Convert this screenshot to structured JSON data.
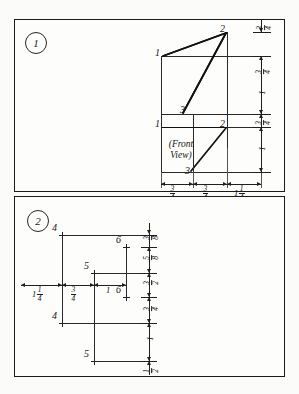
{
  "sheet": {
    "background_color": "#fbfbf9",
    "ink_color": "#111111"
  },
  "panels": [
    {
      "badge": "1",
      "view_label": "(Front\nView)",
      "view_label_line1": "(Front",
      "view_label_line2": "View)",
      "point_labels": [
        "1",
        "2",
        "1",
        "3",
        "2",
        "3"
      ],
      "points": {
        "top_left": "1",
        "apex": "2",
        "mid_left": "1",
        "mid": "3",
        "lower_right": "2",
        "lower": "3"
      },
      "horizontal_dimensions": [
        {
          "whole": "",
          "num": "3",
          "den": "4"
        },
        {
          "whole": "",
          "num": "3",
          "den": "4"
        },
        {
          "whole": "1",
          "num": "1",
          "den": "4"
        }
      ],
      "vertical_dimensions": [
        {
          "whole": "",
          "num": "3",
          "den": "4"
        },
        {
          "whole": "",
          "num": "3",
          "den": "4"
        },
        {
          "whole": "1",
          "num": "",
          "den": ""
        },
        {
          "whole": "",
          "num": "3",
          "den": "4"
        },
        {
          "whole": "1",
          "num": "",
          "den": ""
        }
      ]
    },
    {
      "badge": "2",
      "point_labels": [
        "4",
        "6",
        "5",
        "6",
        "4",
        "5"
      ],
      "points": {
        "top_left": "4",
        "upper_right": "6",
        "mid_left": "5",
        "mid_right": "6",
        "lower_left": "4",
        "bottom_left": "5"
      },
      "horizontal_dimensions": [
        {
          "whole": "1",
          "num": "1",
          "den": "4"
        },
        {
          "whole": "",
          "num": "3",
          "den": "4"
        },
        {
          "whole": "1",
          "num": "",
          "den": ""
        }
      ],
      "vertical_dimensions": [
        {
          "whole": "",
          "num": "3",
          "den": "8"
        },
        {
          "whole": "",
          "num": "5",
          "den": "8"
        },
        {
          "whole": "",
          "num": "3",
          "den": "2"
        },
        {
          "whole": "",
          "num": "3",
          "den": "4"
        },
        {
          "whole": "1",
          "num": "",
          "den": ""
        },
        {
          "whole": "",
          "num": "1",
          "den": "2"
        }
      ]
    }
  ]
}
